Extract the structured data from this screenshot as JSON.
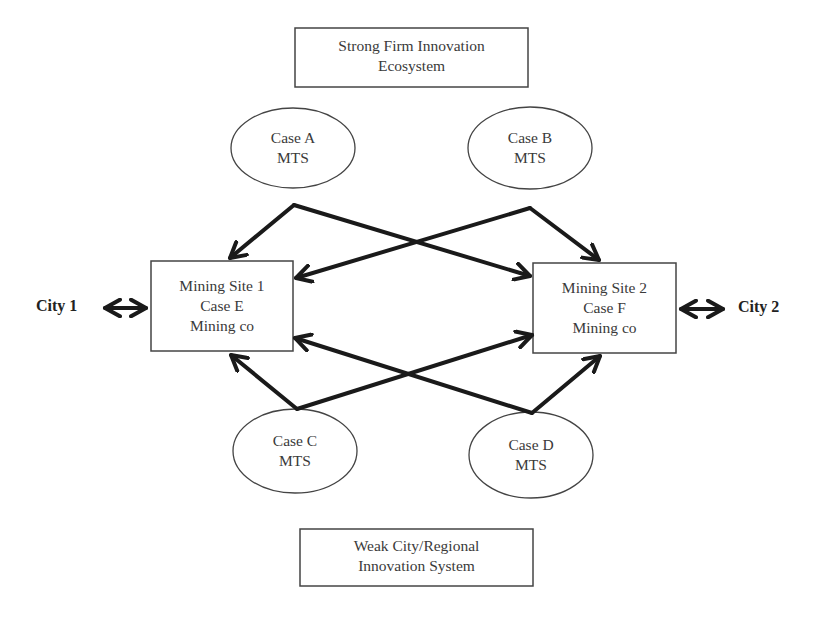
{
  "diagram": {
    "top_box": {
      "line1": "Strong Firm Innovation",
      "line2": "Ecosystem"
    },
    "bottom_box": {
      "line1": "Weak City/Regional",
      "line2": "Innovation System"
    },
    "ellipses": [
      {
        "id": "A",
        "line1": "Case A",
        "line2": "MTS"
      },
      {
        "id": "B",
        "line1": "Case B",
        "line2": "MTS"
      },
      {
        "id": "C",
        "line1": "Case C",
        "line2": "MTS"
      },
      {
        "id": "D",
        "line1": "Case D",
        "line2": "MTS"
      }
    ],
    "sites": [
      {
        "id": "site1",
        "line1": "Mining Site 1",
        "line2": "Case E",
        "line3": "Mining co"
      },
      {
        "id": "site2",
        "line1": "Mining Site 2",
        "line2": "Case F",
        "line3": "Mining co"
      }
    ],
    "cities": [
      {
        "id": "city1",
        "label": "City 1"
      },
      {
        "id": "city2",
        "label": "City 2"
      }
    ],
    "edges": [
      {
        "from": "Case A",
        "to": "Mining Site 1"
      },
      {
        "from": "Case A",
        "to": "Mining Site 2"
      },
      {
        "from": "Case B",
        "to": "Mining Site 1"
      },
      {
        "from": "Case B",
        "to": "Mining Site 2"
      },
      {
        "from": "Case C",
        "to": "Mining Site 1"
      },
      {
        "from": "Case C",
        "to": "Mining Site 2"
      },
      {
        "from": "Case D",
        "to": "Mining Site 1"
      },
      {
        "from": "Case D",
        "to": "Mining Site 2"
      },
      {
        "from": "City 1",
        "to": "Mining Site 1",
        "bidirectional": true
      },
      {
        "from": "Mining Site 2",
        "to": "City 2",
        "bidirectional": true
      }
    ],
    "colors": {
      "stroke": "#1a1a1a",
      "box_border": "#444444",
      "text": "#3a3a3a"
    }
  }
}
